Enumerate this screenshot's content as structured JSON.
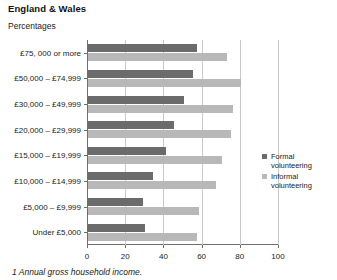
{
  "header": {
    "title": "England & Wales",
    "subtitle": "Percentages"
  },
  "footnote": "1 Annual gross household income.",
  "legend": {
    "position": "right",
    "items": [
      {
        "label_line1": "Formal",
        "label_line2": "volunteering",
        "color": "#6b6b6b",
        "swatch": "formal-swatch"
      },
      {
        "label_line1": "Informal",
        "label_line2": "volunteering",
        "color": "#b8b8b8",
        "swatch": "informal-swatch"
      }
    ]
  },
  "chart_data": {
    "type": "bar",
    "orientation": "horizontal",
    "title": "England & Wales",
    "subtitle": "Percentages",
    "xlabel": "",
    "ylabel": "",
    "xlim": [
      0,
      100
    ],
    "xticks": [
      0,
      20,
      40,
      60,
      80,
      100
    ],
    "grid": true,
    "categories": [
      "£75, 000 or more",
      "£50,000 – £74,999",
      "£30,000 –  £49,999",
      "£20,000 – £29,999",
      "£15,000 – £19,999",
      "£10,000 – £14,999",
      "£5,000 – £9,999",
      "Under £5,000"
    ],
    "series": [
      {
        "name": "Formal volunteering",
        "color": "#6b6b6b",
        "values": [
          57,
          55,
          50,
          45,
          41,
          34,
          29,
          30
        ]
      },
      {
        "name": "Informal volunteering",
        "color": "#b8b8b8",
        "values": [
          73,
          80,
          76,
          75,
          70,
          67,
          58,
          57
        ]
      }
    ]
  }
}
